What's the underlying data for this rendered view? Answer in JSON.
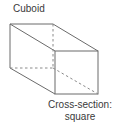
{
  "diagram": {
    "title": "Cuboid",
    "caption_line1": "Cross-section:",
    "caption_line2": "square",
    "shape": "cuboid",
    "line_color": "#6b6b6b",
    "vertices": {
      "back_top_left": [
        10,
        24
      ],
      "back_top_right": [
        53,
        24
      ],
      "back_bottom_left": [
        10,
        68
      ],
      "back_bottom_right": [
        53,
        68
      ],
      "front_top_left": [
        55,
        51
      ],
      "front_top_right": [
        98,
        51
      ],
      "front_bottom_left": [
        55,
        94
      ],
      "front_bottom_right": [
        98,
        94
      ]
    },
    "hidden_edges": [
      "back_top_right-back_bottom_right",
      "back_bottom_left-back_bottom_right",
      "back_bottom_right-front_bottom_right"
    ]
  }
}
